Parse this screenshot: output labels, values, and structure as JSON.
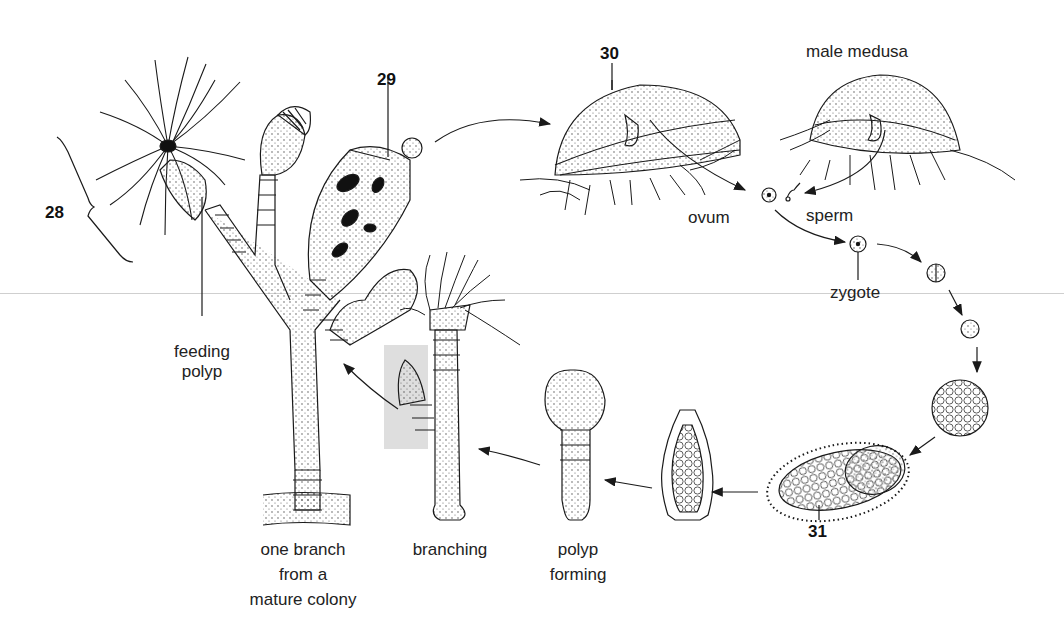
{
  "diagram": {
    "labels": {
      "num_28": "28",
      "num_29": "29",
      "num_30": "30",
      "num_31": "31",
      "male_medusa": "male medusa",
      "ovum": "ovum",
      "sperm": "sperm",
      "zygote": "zygote",
      "feeding_polyp_line1": "feeding",
      "feeding_polyp_line2": "polyp",
      "colony_line1": "one branch",
      "colony_line2": "from a",
      "colony_line3": "mature colony",
      "branching": "branching",
      "polyp_forming_line1": "polyp",
      "polyp_forming_line2": "forming"
    },
    "stages": [
      "one branch from a mature colony",
      "reproductive polyp (29)",
      "female medusa (30)",
      "male medusa",
      "ovum",
      "sperm",
      "zygote",
      "2-cell stage",
      "4-cell stage",
      "blastula",
      "planula larva (31)",
      "settled larva",
      "polyp forming",
      "branching"
    ],
    "colors": {
      "line": "#1a1a1a",
      "highlight": "#d8d8d8",
      "background": "#ffffff"
    }
  }
}
